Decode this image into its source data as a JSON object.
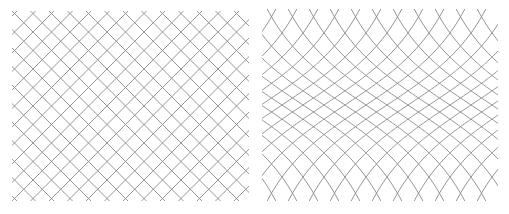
{
  "figure": {
    "background": "#ffffff",
    "line_color": "#8a8a8a",
    "line_width": 0.9
  },
  "panels": [
    {
      "name": "regular-diagonal-grid",
      "type": "diagonal-grid",
      "box": {
        "x": 12,
        "y": 11,
        "w": 237,
        "h": 190
      },
      "spacing": 18.5,
      "angle_deg": 45,
      "offset_x": 17,
      "offset_y": 21
    },
    {
      "name": "warped-grid",
      "type": "warped-grid",
      "box": {
        "x": 262,
        "y": 9,
        "w": 236,
        "h": 192
      },
      "column_spacing": 21,
      "x_offset": 282,
      "center_y": 105,
      "amplitude": 5,
      "scale": 70
    }
  ]
}
